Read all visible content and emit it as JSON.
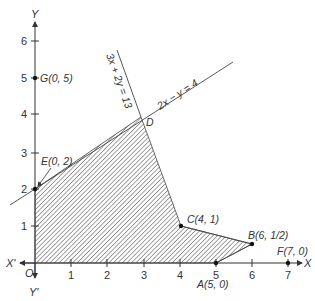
{
  "axes": {
    "x_label": "X",
    "x_neg_label": "X'",
    "y_label": "Y",
    "y_neg_label": "Y'",
    "origin_label": "O",
    "x_ticks": [
      "1",
      "2",
      "3",
      "4",
      "5",
      "6",
      "7"
    ],
    "y_ticks": [
      "1",
      "2",
      "3",
      "4",
      "5",
      "6"
    ]
  },
  "lines": [
    {
      "name": "line-3x-2y-13",
      "label": "3x + 2y = 13"
    },
    {
      "name": "line-2x-y-4",
      "label": "2x − y = 4"
    }
  ],
  "points": [
    {
      "id": "A",
      "label": "A(5, 0)",
      "x": 5,
      "y": 0
    },
    {
      "id": "B",
      "label": "B(6, 1/2)",
      "x": 6,
      "y": 0.5
    },
    {
      "id": "C",
      "label": "C(4, 1)",
      "x": 4,
      "y": 1
    },
    {
      "id": "D",
      "label": "D",
      "x": 3,
      "y": 4
    },
    {
      "id": "E",
      "label": "E(0, 2)",
      "x": 0,
      "y": 2
    },
    {
      "id": "F",
      "label": "F(7, 0)",
      "x": 7,
      "y": 0
    },
    {
      "id": "G",
      "label": "G(0, 5)",
      "x": 0,
      "y": 5
    }
  ],
  "feasible_region": {
    "vertices": [
      "O",
      "E",
      "D",
      "C",
      "B",
      "A"
    ],
    "fill": "hatched",
    "hatch_color": "#555555"
  },
  "colors": {
    "line": "#444444",
    "axis": "#333333",
    "point": "#111111"
  }
}
